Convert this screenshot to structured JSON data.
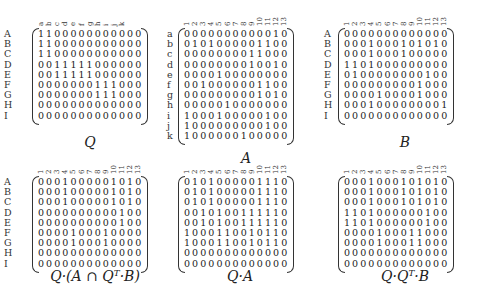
{
  "matrices": [
    {
      "id": "Q",
      "caption": "Q",
      "col_labels": [
        "a",
        "b",
        "c",
        "d",
        "e",
        "f",
        "g",
        "h",
        "i",
        "j",
        "k"
      ],
      "row_labels": [
        "A",
        "B",
        "C",
        "D",
        "E",
        "F",
        "G",
        "H",
        "I"
      ],
      "rows": [
        "1100000000000",
        "1100000000000",
        "1100000000000",
        "0011111000000",
        "0011111000000",
        "0000000111000",
        "0000000111000",
        "0000000000000",
        "0000000000000"
      ]
    },
    {
      "id": "A",
      "caption": "A",
      "col_labels": [
        "1",
        "2",
        "3",
        "4",
        "5",
        "6",
        "7",
        "8",
        "9",
        "10",
        "11",
        "12",
        "13"
      ],
      "row_labels": [
        "a",
        "b",
        "c",
        "d",
        "e",
        "f",
        "g",
        "h",
        "i",
        "j",
        "k"
      ],
      "rows": [
        "0000000000010",
        "0101000001100",
        "0000000011000",
        "0000000010010",
        "0000100000000",
        "0010000001100",
        "0000000001010",
        "0000010000000",
        "1000100000100",
        "1000000000100",
        "1000000100000"
      ]
    },
    {
      "id": "B",
      "caption": "B",
      "col_labels": [
        "1",
        "2",
        "3",
        "4",
        "5",
        "6",
        "7",
        "8",
        "9",
        "10",
        "11",
        "12",
        "13"
      ],
      "row_labels": [
        "A",
        "B",
        "C",
        "D",
        "E",
        "F",
        "G",
        "H",
        "I"
      ],
      "rows": [
        "0000000000000",
        "0001000101010",
        "0001000100000",
        "1101000000000",
        "0100000000100",
        "0000000001000",
        "0000100001000",
        "0001000000001",
        "0000000000000"
      ]
    },
    {
      "id": "Q_A_cap_QtB",
      "caption": "Q·(A ∩ Qᵀ·B)",
      "col_labels": [
        "1",
        "2",
        "3",
        "4",
        "5",
        "6",
        "7",
        "8",
        "9",
        "10",
        "11",
        "12",
        "13"
      ],
      "row_labels": [
        "A",
        "B",
        "C",
        "D",
        "E",
        "F",
        "G",
        "H",
        "I"
      ],
      "rows": [
        "0001000001010",
        "0001000001010",
        "0001000001010",
        "0000000000100",
        "0000000000100",
        "0000100010000",
        "0000100010000",
        "0000000000000",
        "0000000000000"
      ]
    },
    {
      "id": "Q_A",
      "caption": "Q·A",
      "col_labels": [
        "1",
        "2",
        "3",
        "4",
        "5",
        "6",
        "7",
        "8",
        "9",
        "10",
        "11",
        "12",
        "13"
      ],
      "row_labels": [],
      "rows": [
        "0101000001110",
        "0101000001110",
        "0101000001110",
        "0010100111110",
        "0010100111110",
        "1000110010110",
        "1000110010110",
        "0000000000000",
        "0000000000000"
      ]
    },
    {
      "id": "Q_Qt_B",
      "caption": "Q·Qᵀ·B",
      "col_labels": [
        "1",
        "2",
        "3",
        "4",
        "5",
        "6",
        "7",
        "8",
        "9",
        "10",
        "11",
        "12",
        "13"
      ],
      "row_labels": [],
      "rows": [
        "0001000101010",
        "0001000101010",
        "0001000101010",
        "1101000000100",
        "1101000000100",
        "0000100011000",
        "0000100011000",
        "0000000000000",
        "0000000000000"
      ]
    }
  ]
}
